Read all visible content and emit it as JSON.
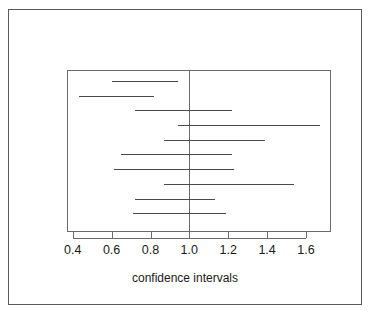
{
  "chart_data": {
    "type": "line",
    "title": "",
    "xlabel": "confidence intervals",
    "ylabel": "",
    "xlim": [
      0.33,
      1.68
    ],
    "xticks": [
      0.4,
      0.6,
      0.8,
      1.0,
      1.2,
      1.4,
      1.6
    ],
    "xtick_labels": [
      "0.4",
      "0.6",
      "0.8",
      "1.0",
      "1.2",
      "1.4",
      "1.6"
    ],
    "grid": false,
    "legend": null,
    "reference_line": 1.0,
    "n_intervals": 10,
    "intervals": [
      {
        "index": 1,
        "lower": 0.6,
        "upper": 0.94
      },
      {
        "index": 2,
        "lower": 0.43,
        "upper": 0.82
      },
      {
        "index": 3,
        "lower": 0.72,
        "upper": 1.22
      },
      {
        "index": 4,
        "lower": 0.94,
        "upper": 1.67
      },
      {
        "index": 5,
        "lower": 0.87,
        "upper": 1.39
      },
      {
        "index": 6,
        "lower": 0.65,
        "upper": 1.22
      },
      {
        "index": 7,
        "lower": 0.61,
        "upper": 1.23
      },
      {
        "index": 8,
        "lower": 0.87,
        "upper": 1.54
      },
      {
        "index": 9,
        "lower": 0.72,
        "upper": 1.13
      },
      {
        "index": 10,
        "lower": 0.71,
        "upper": 1.19
      }
    ]
  },
  "figure": {
    "axis_title": "confidence intervals",
    "frame_color": "#5a5a5a",
    "line_color": "#4a4a4a",
    "background": "#ffffff"
  }
}
